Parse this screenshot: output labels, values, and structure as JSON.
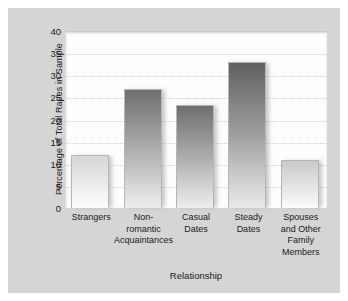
{
  "chart_data": {
    "type": "bar",
    "title": "",
    "subtitle": "",
    "xlabel": "Relationship",
    "ylabel": "Percentage of Total Rapes in Sample",
    "categories": [
      "Strangers",
      "Non-romantic Acquaintances",
      "Casual Dates",
      "Steady Dates",
      "Spouses and Other Family Members"
    ],
    "category_lines": [
      [
        "Strangers"
      ],
      [
        "Non-",
        "romantic",
        "Acquaintances"
      ],
      [
        "Casual",
        "Dates"
      ],
      [
        "Steady",
        "Dates"
      ],
      [
        "Spouses",
        "and Other",
        "Family",
        "Members"
      ]
    ],
    "values": [
      12,
      26.8,
      23.3,
      33,
      10.8
    ],
    "ylim": [
      0,
      40
    ],
    "yticks": [
      40,
      35,
      30,
      25,
      20,
      15,
      10,
      5,
      0
    ],
    "grid": true,
    "legend": "none",
    "orientation": "vertical"
  },
  "figure": {
    "panel_color": "#d5d5d5",
    "plot_background": "#fdfdfd",
    "gridline_color": "#cfcfcf",
    "bar_top_color": "#6f6f6f",
    "bar_bottom_color": "#f4f4f4",
    "text_color": "#1a1a1a"
  }
}
